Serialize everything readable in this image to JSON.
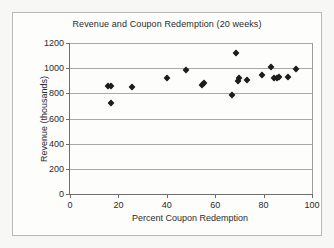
{
  "chart_data": {
    "type": "scatter",
    "title": "Revenue and Coupon Redemption (20 weeks)",
    "xlabel": "Percent Coupon Redemption",
    "ylabel": "Revenue (thousands)",
    "xlim": [
      0,
      100
    ],
    "ylim": [
      0,
      1200
    ],
    "x_ticks": [
      0,
      20,
      40,
      60,
      80,
      100
    ],
    "y_ticks": [
      0,
      200,
      400,
      600,
      800,
      1000,
      1200
    ],
    "grid": "horizontal",
    "legend": "none",
    "marker": "diamond",
    "marker_color": "#1d1d1d",
    "points": [
      {
        "x": 15.5,
        "y": 855
      },
      {
        "x": 17.0,
        "y": 855
      },
      {
        "x": 17.0,
        "y": 720
      },
      {
        "x": 25.5,
        "y": 850
      },
      {
        "x": 40.0,
        "y": 920
      },
      {
        "x": 48.0,
        "y": 985
      },
      {
        "x": 54.5,
        "y": 870
      },
      {
        "x": 55.5,
        "y": 880
      },
      {
        "x": 67.0,
        "y": 785
      },
      {
        "x": 68.5,
        "y": 1120
      },
      {
        "x": 69.5,
        "y": 900
      },
      {
        "x": 70.0,
        "y": 920
      },
      {
        "x": 73.0,
        "y": 905
      },
      {
        "x": 79.5,
        "y": 948
      },
      {
        "x": 83.0,
        "y": 1010
      },
      {
        "x": 84.5,
        "y": 925
      },
      {
        "x": 85.5,
        "y": 925
      },
      {
        "x": 86.5,
        "y": 928
      },
      {
        "x": 90.0,
        "y": 930
      },
      {
        "x": 93.5,
        "y": 990
      }
    ]
  }
}
